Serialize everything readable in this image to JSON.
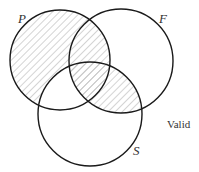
{
  "diagram": {
    "type": "venn-3",
    "circles": [
      {
        "id": "P",
        "label": "P",
        "cx": 60,
        "cy": 60,
        "r": 50
      },
      {
        "id": "F",
        "label": "F",
        "cx": 121,
        "cy": 61,
        "r": 52
      },
      {
        "id": "S",
        "label": "S",
        "cx": 90,
        "cy": 114,
        "r": 52
      }
    ],
    "shaded_regions": [
      "P only",
      "P∩F not S",
      "P∩F∩S",
      "F∩S not P"
    ],
    "unshaded_regions": [
      "F only",
      "S only",
      "P∩S not F"
    ],
    "verdict": "Valid",
    "colors": {
      "stroke": "#1a1a1a",
      "hatch": "#b0b0b0",
      "background": "#ffffff"
    }
  }
}
